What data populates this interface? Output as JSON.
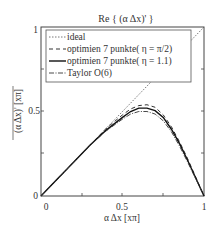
{
  "chart_data": {
    "type": "line",
    "title": "Re { (α Δx)' }",
    "xlabel": "α Δx [xπ]",
    "ylabel": "(α Δx)' [xπ]",
    "xlim": [
      0,
      1
    ],
    "ylim": [
      0,
      1
    ],
    "xticks": [
      "0",
      "0.5",
      "1"
    ],
    "yticks": [
      "0",
      "0.5",
      "1"
    ],
    "grid": false,
    "legend_position": "upper-left",
    "series": [
      {
        "name": "ideal",
        "style": "dotted",
        "x": [
          0,
          1
        ],
        "y": [
          0,
          1
        ]
      },
      {
        "name": "optimien 7 punkte( η = π/2)",
        "style": "dashed",
        "x": [
          0,
          0.1,
          0.2,
          0.3,
          0.4,
          0.5,
          0.55,
          0.6,
          0.65,
          0.7,
          0.75,
          0.8,
          0.85,
          0.9,
          0.95,
          1.0
        ],
        "y": [
          0,
          0.1,
          0.2,
          0.3,
          0.4,
          0.48,
          0.515,
          0.535,
          0.54,
          0.525,
          0.48,
          0.41,
          0.32,
          0.22,
          0.11,
          0
        ]
      },
      {
        "name": "optimien 7 punkte( η = 1.1)",
        "style": "solid",
        "x": [
          0,
          0.1,
          0.2,
          0.3,
          0.4,
          0.5,
          0.55,
          0.6,
          0.65,
          0.7,
          0.75,
          0.8,
          0.85,
          0.9,
          0.95,
          1.0
        ],
        "y": [
          0,
          0.1,
          0.2,
          0.3,
          0.39,
          0.465,
          0.5,
          0.52,
          0.52,
          0.505,
          0.465,
          0.395,
          0.31,
          0.21,
          0.105,
          0
        ]
      },
      {
        "name": "Taylor O(6)",
        "style": "dash-dot",
        "x": [
          0,
          0.1,
          0.2,
          0.3,
          0.4,
          0.5,
          0.55,
          0.6,
          0.65,
          0.7,
          0.75,
          0.8,
          0.85,
          0.9,
          0.95,
          1.0
        ],
        "y": [
          0,
          0.1,
          0.2,
          0.3,
          0.385,
          0.455,
          0.485,
          0.5,
          0.5,
          0.485,
          0.445,
          0.38,
          0.295,
          0.2,
          0.1,
          0
        ]
      }
    ]
  },
  "labels": {
    "title": "Re { (α Δx)' }",
    "xlabel": "α Δx [xπ]",
    "ylabel": "(α Δx)' [xπ]",
    "xtick0": "0",
    "xtick1": "0.5",
    "xtick2": "1",
    "ytick0": "0",
    "ytick1": "0.5",
    "ytick2": "1",
    "legend0": "ideal",
    "legend1": "optimien 7 punkte( η = π/2)",
    "legend2": "optimien 7 punkte( η = 1.1)",
    "legend3": "Taylor O(6)"
  }
}
